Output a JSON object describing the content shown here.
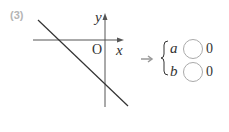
{
  "problem": {
    "number_label": "(3)"
  },
  "graph": {
    "x_axis_label": "x",
    "y_axis_label": "y",
    "origin_label": "O",
    "line": {
      "slope_sign": "negative",
      "y_intercept_sign": "negative"
    },
    "colors": {
      "axis": "#555555",
      "line": "#333333"
    }
  },
  "answer": {
    "arrow": "→",
    "rows": [
      {
        "variable": "a",
        "blank": "",
        "value": "0"
      },
      {
        "variable": "b",
        "blank": "",
        "value": "0"
      }
    ],
    "colors": {
      "arrow": "#999999",
      "circle": "#aaaaaa"
    }
  }
}
